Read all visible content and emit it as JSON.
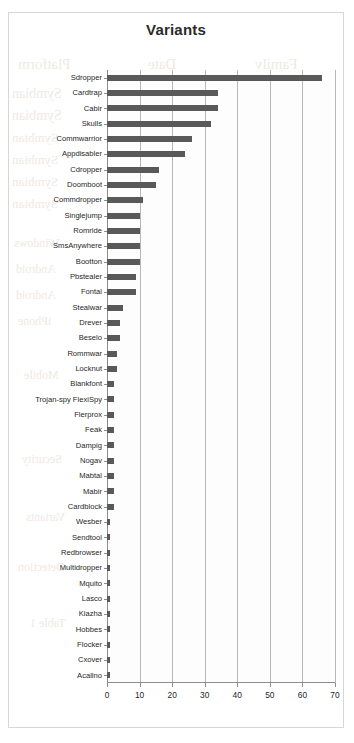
{
  "chart_data": {
    "type": "bar",
    "orientation": "horizontal",
    "title": "Variants",
    "xlabel": "",
    "ylabel": "",
    "xlim": [
      0,
      70
    ],
    "xticks": [
      0,
      10,
      20,
      30,
      40,
      50,
      60,
      70
    ],
    "grid": true,
    "legend": false,
    "bar_color": "#595959",
    "categories": [
      "Sdropper",
      "Cardtrap",
      "Cabir",
      "Skulls",
      "Commwarrior",
      "Appdisabler",
      "Cdropper",
      "Doomboot",
      "Commdropper",
      "Singlejump",
      "Romride",
      "SmsAnywhere",
      "Bootton",
      "Pbstealer",
      "Fontal",
      "Stealwar",
      "Drever",
      "Beselo",
      "Rommwar",
      "Locknut",
      "Blankfont",
      "Trojan-spy FlexiSpy",
      "Flerprox",
      "Feak",
      "Dampig",
      "Nogav",
      "Mabtal",
      "Mabir",
      "Cardblock",
      "Wesber",
      "Sendtool",
      "Redbrowser",
      "Multidropper",
      "Mquito",
      "Lasco",
      "Kiazha",
      "Hobbes",
      "Flocker",
      "Cxover",
      "Acallno"
    ],
    "values": [
      66,
      34,
      34,
      32,
      26,
      24,
      16,
      15,
      11,
      10,
      10,
      10,
      10,
      9,
      9,
      5,
      4,
      4,
      3,
      3,
      2,
      2,
      2,
      2,
      2,
      2,
      2,
      2,
      2,
      1,
      1,
      1,
      1,
      1,
      1,
      1,
      1,
      1,
      1,
      1
    ]
  },
  "bleed_text": [
    {
      "text": "Platform",
      "x": 18,
      "y": 56,
      "size": 15
    },
    {
      "text": "Date",
      "x": 148,
      "y": 56,
      "size": 15
    },
    {
      "text": "Family",
      "x": 255,
      "y": 56,
      "size": 15
    },
    {
      "text": "Symbian",
      "x": 12,
      "y": 86,
      "size": 14
    },
    {
      "text": "Symbian",
      "x": 12,
      "y": 108,
      "size": 14
    },
    {
      "text": "Symbian",
      "x": 12,
      "y": 130,
      "size": 13
    },
    {
      "text": "Symbian",
      "x": 12,
      "y": 152,
      "size": 13
    },
    {
      "text": "Symbian",
      "x": 12,
      "y": 174,
      "size": 13
    },
    {
      "text": "Symbian",
      "x": 12,
      "y": 196,
      "size": 13
    },
    {
      "text": "Cabir",
      "x": 236,
      "y": 86,
      "size": 13
    },
    {
      "text": "Skulls",
      "x": 236,
      "y": 108,
      "size": 13
    },
    {
      "text": "Cardtrap",
      "x": 232,
      "y": 130,
      "size": 12
    },
    {
      "text": "Fontal",
      "x": 236,
      "y": 152,
      "size": 12
    },
    {
      "text": "Locknut",
      "x": 233,
      "y": 174,
      "size": 12
    },
    {
      "text": "Doomboot",
      "x": 228,
      "y": 196,
      "size": 12
    },
    {
      "text": "2004",
      "x": 150,
      "y": 86,
      "size": 13
    },
    {
      "text": "2004",
      "x": 150,
      "y": 108,
      "size": 13
    },
    {
      "text": "2005",
      "x": 150,
      "y": 130,
      "size": 12
    },
    {
      "text": "2005",
      "x": 150,
      "y": 152,
      "size": 12
    },
    {
      "text": "2005",
      "x": 150,
      "y": 174,
      "size": 12
    },
    {
      "text": "2005",
      "x": 150,
      "y": 196,
      "size": 12
    },
    {
      "text": "Windows",
      "x": 14,
      "y": 236,
      "size": 12
    },
    {
      "text": "Android",
      "x": 16,
      "y": 262,
      "size": 12
    },
    {
      "text": "Android",
      "x": 16,
      "y": 288,
      "size": 12
    },
    {
      "text": "iPhone",
      "x": 18,
      "y": 314,
      "size": 12
    },
    {
      "text": "Malware",
      "x": 200,
      "y": 236,
      "size": 12
    },
    {
      "text": "Spyware",
      "x": 200,
      "y": 262,
      "size": 12
    },
    {
      "text": "Trojan",
      "x": 206,
      "y": 288,
      "size": 12
    },
    {
      "text": "Worm",
      "x": 208,
      "y": 314,
      "size": 12
    },
    {
      "text": "2009",
      "x": 152,
      "y": 236,
      "size": 12
    },
    {
      "text": "2010",
      "x": 152,
      "y": 262,
      "size": 12
    },
    {
      "text": "2011",
      "x": 152,
      "y": 288,
      "size": 12
    },
    {
      "text": "2012",
      "x": 152,
      "y": 314,
      "size": 12
    },
    {
      "text": "Mobile",
      "x": 24,
      "y": 368,
      "size": 12
    },
    {
      "text": "Threat",
      "x": 200,
      "y": 368,
      "size": 12
    },
    {
      "text": "Report",
      "x": 210,
      "y": 410,
      "size": 12
    },
    {
      "text": "Security",
      "x": 22,
      "y": 452,
      "size": 12
    },
    {
      "text": "Analysis",
      "x": 204,
      "y": 452,
      "size": 12
    },
    {
      "text": "Variants",
      "x": 26,
      "y": 510,
      "size": 12
    },
    {
      "text": "Samples",
      "x": 204,
      "y": 510,
      "size": 12
    },
    {
      "text": "Detection",
      "x": 18,
      "y": 560,
      "size": 12
    },
    {
      "text": "Summary",
      "x": 202,
      "y": 560,
      "size": 12
    },
    {
      "text": "Table 1",
      "x": 30,
      "y": 616,
      "size": 12
    },
    {
      "text": "Figure 2",
      "x": 206,
      "y": 616,
      "size": 12
    }
  ]
}
